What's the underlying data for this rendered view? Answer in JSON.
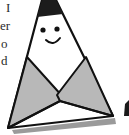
{
  "page": {
    "text_fragments": [
      {
        "text": "I",
        "x": 6,
        "y": 1
      },
      {
        "text": "er",
        "x": 0,
        "y": 19
      },
      {
        "text": "o",
        "x": 1,
        "y": 37
      },
      {
        "text": "d",
        "x": 1,
        "y": 54
      }
    ]
  },
  "illustration": {
    "subject": "smiling triangle character with folded arms",
    "colors": {
      "outline": "#111111",
      "cap": "#1c1c1c",
      "body": "#ffffff",
      "arms": "#b8b8b8",
      "shadow": "#9a9a9a"
    }
  }
}
